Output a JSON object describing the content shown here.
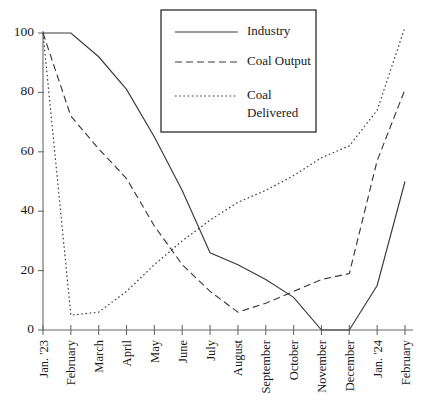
{
  "chart_data": {
    "type": "line",
    "title": "",
    "subtitle": "",
    "xlabel": "",
    "ylabel": "",
    "ylim": [
      0,
      100
    ],
    "yticks": [
      0,
      20,
      40,
      60,
      80,
      100
    ],
    "ytick_labels": [
      "0",
      "20",
      "40",
      "60",
      "80",
      "100"
    ],
    "grid": false,
    "legend_position": "top-center",
    "categories": [
      "Jan. '23",
      "February",
      "March",
      "April",
      "May",
      "June",
      "July",
      "August",
      "September",
      "October",
      "November",
      "December",
      "Jan. '24",
      "February"
    ],
    "series": [
      {
        "name": "Industry",
        "line_style": "solid",
        "values": [
          100,
          100,
          92,
          81,
          65,
          47,
          26,
          22,
          17,
          11,
          0,
          0,
          15,
          50
        ]
      },
      {
        "name": "Coal Output",
        "line_style": "dashed",
        "values": [
          100,
          72,
          61,
          51,
          35,
          22,
          13,
          6,
          9,
          13,
          17,
          19,
          57,
          81
        ]
      },
      {
        "name": "Coal Delivered",
        "line_style": "dotted",
        "values": [
          100,
          5,
          6,
          13,
          22,
          30,
          37,
          43,
          47,
          52,
          58,
          62,
          74,
          102
        ]
      }
    ]
  },
  "legend": {
    "entries": [
      {
        "label": "Industry",
        "label_line2": ""
      },
      {
        "label": "Coal Output",
        "label_line2": ""
      },
      {
        "label": "Coal",
        "label_line2": "Delivered"
      }
    ]
  },
  "colors": {
    "line": "#3a3a3a",
    "axis": "#6b6b6b",
    "text": "#1a1a1a",
    "background": "#ffffff"
  }
}
